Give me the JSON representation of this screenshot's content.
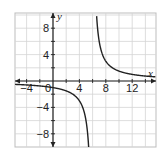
{
  "chart_data": {
    "type": "line",
    "title": "",
    "xlabel": "x",
    "ylabel": "y",
    "function": "y = 6/(x - 6)",
    "vertical_asymptote": 6,
    "horizontal_asymptote": 0,
    "xlim": [
      -5.8,
      15.6
    ],
    "ylim": [
      -10,
      10.3
    ],
    "grid": true,
    "grid_step": 2,
    "x_ticks": [
      -4,
      0,
      4,
      8,
      12
    ],
    "y_ticks": [
      8,
      4,
      -4,
      -8
    ],
    "x_tick_labels": [
      "−4",
      "0",
      "4",
      "8",
      "12"
    ],
    "y_tick_labels": [
      "8",
      "4",
      "−4",
      "−8"
    ],
    "series": [
      {
        "name": "left branch",
        "x": [
          -5.8,
          -4,
          -2,
          0,
          2,
          3,
          4,
          4.5,
          5,
          5.4
        ],
        "y": [
          -0.51,
          -0.6,
          -0.75,
          -1,
          -1.5,
          -2,
          -3,
          -4,
          -6,
          -10
        ]
      },
      {
        "name": "right branch",
        "x": [
          6.6,
          7,
          8,
          9,
          10,
          12,
          14,
          15.6
        ],
        "y": [
          10,
          6,
          3,
          2,
          1.5,
          1,
          0.75,
          0.63
        ]
      }
    ],
    "colors": {
      "curve": "#222222",
      "axes": "#222222",
      "grid": "#cfcfcf"
    }
  }
}
